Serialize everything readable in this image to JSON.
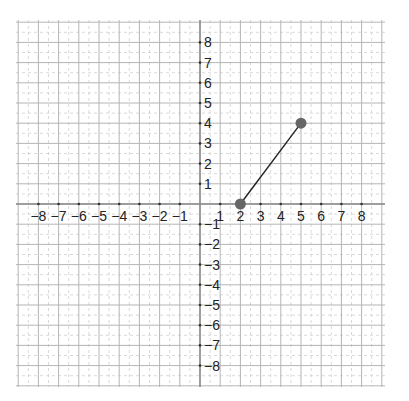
{
  "chart_data": {
    "type": "line",
    "title": "",
    "xlabel": "",
    "ylabel": "",
    "xlim": [
      -9,
      9
    ],
    "ylim": [
      -9,
      9
    ],
    "grid": true,
    "minor_grid": "dashed half-units",
    "x_tick_labels": [
      "−8",
      "−7",
      "−6",
      "−5",
      "−4",
      "−3",
      "−2",
      "−1",
      "1",
      "2",
      "3",
      "4",
      "5",
      "6",
      "7",
      "8"
    ],
    "y_tick_labels": [
      "8",
      "7",
      "6",
      "5",
      "4",
      "3",
      "2",
      "1",
      "−1",
      "−2",
      "−3",
      "−4",
      "−5",
      "−6",
      "−7",
      "−8"
    ],
    "series": [
      {
        "name": "segment",
        "points": [
          [
            2,
            0
          ],
          [
            5,
            4
          ]
        ],
        "markers": true,
        "color": "#666666",
        "line_color": "#222222"
      }
    ]
  },
  "colors": {
    "major_grid": "#b5b5b5",
    "minor_grid": "#cfcfcf",
    "axis": "#888888",
    "marker": "#6b6b6b"
  }
}
